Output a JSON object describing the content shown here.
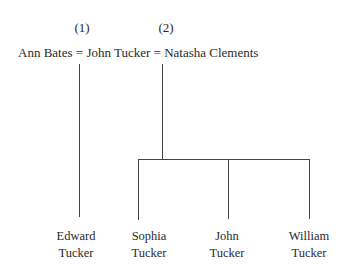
{
  "diagram": {
    "type": "family-tree",
    "marriage_numbers": [
      "(1)",
      "(2)"
    ],
    "spouse_line": {
      "spouse1": "Ann Bates",
      "sep1": "=",
      "center": "John Tucker",
      "sep2": "=",
      "spouse2": "Natasha Clements"
    },
    "children": [
      {
        "first": "Edward",
        "last": "Tucker",
        "marriage": 1
      },
      {
        "first": "Sophia",
        "last": "Tucker",
        "marriage": 2
      },
      {
        "first": "John",
        "last": "Tucker",
        "marriage": 2
      },
      {
        "first": "William",
        "last": "Tucker",
        "marriage": 2
      }
    ]
  }
}
